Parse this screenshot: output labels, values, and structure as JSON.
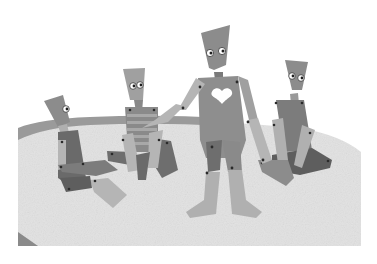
{
  "image": {
    "description": "Grayscale illustration of four jointed paper-cutout puppet figures on a round textured mat",
    "width": 377,
    "height": 264
  },
  "colors": {
    "background": "#ffffff",
    "mat": "#e2e2e2",
    "mat_rim": "#9a9a9a",
    "body_mid": "#8c8c8c",
    "body_light": "#b5b5b5",
    "body_dark": "#5e5e5e",
    "heart": "#ffffff",
    "joint": "#2a2a2a"
  },
  "figures": [
    {
      "name": "seated-left-puppet",
      "pose": "sitting, legs forward",
      "face": "profile, one eye"
    },
    {
      "name": "seated-striped-puppet",
      "pose": "sitting, knees up",
      "torso": "striped"
    },
    {
      "name": "standing-heart-puppet",
      "pose": "standing, arm extended pointing",
      "torso": "heart cutout"
    },
    {
      "name": "seated-right-puppet",
      "pose": "cross-legged",
      "torso": "textured"
    }
  ]
}
